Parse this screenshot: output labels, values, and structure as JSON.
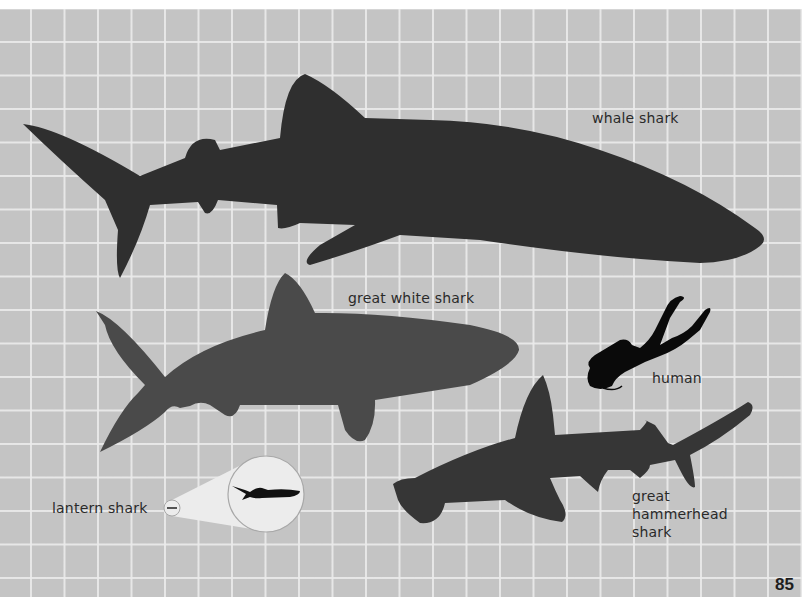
{
  "labels": {
    "whale_shark": "whale shark",
    "great_white_shark": "great white shark",
    "human": "human",
    "lantern_shark": "lantern shark",
    "great_hammerhead_line1": "great",
    "great_hammerhead_line2": "hammerhead",
    "great_hammerhead_line3": "shark"
  },
  "page_number": "85",
  "colors": {
    "background": "#c4c4c4",
    "grid": "#ebebeb",
    "whale_shark": "#2f2f2f",
    "great_white_shark": "#4a4a4a",
    "hammerhead_shark": "#363636",
    "human": "#0a0a0a",
    "magnifier": "#ececec"
  }
}
